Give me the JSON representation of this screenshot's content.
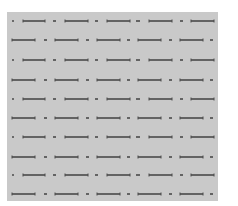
{
  "pattern": {
    "panel_color": "#c9c9c9",
    "stroke_color": "#4a4a4a",
    "rows": [
      {
        "y": 21,
        "segments": [
          [
            12,
            14
          ],
          [
            23,
            45
          ],
          [
            53,
            56
          ],
          [
            65,
            88
          ],
          [
            95,
            98
          ],
          [
            107,
            130
          ],
          [
            136,
            140
          ],
          [
            149,
            172
          ],
          [
            180,
            183
          ],
          [
            191,
            214
          ]
        ]
      },
      {
        "y": 40,
        "segments": [
          [
            12,
            35
          ],
          [
            44,
            47
          ],
          [
            55,
            78
          ],
          [
            86,
            89
          ],
          [
            97,
            120
          ],
          [
            127,
            130
          ],
          [
            138,
            161
          ],
          [
            169,
            172
          ],
          [
            180,
            203
          ],
          [
            210,
            213
          ]
        ]
      },
      {
        "y": 60,
        "segments": [
          [
            12,
            14
          ],
          [
            23,
            45
          ],
          [
            53,
            56
          ],
          [
            65,
            88
          ],
          [
            95,
            98
          ],
          [
            107,
            130
          ],
          [
            136,
            140
          ],
          [
            149,
            172
          ],
          [
            180,
            183
          ],
          [
            191,
            214
          ]
        ]
      },
      {
        "y": 80,
        "segments": [
          [
            12,
            35
          ],
          [
            44,
            47
          ],
          [
            55,
            78
          ],
          [
            86,
            89
          ],
          [
            97,
            120
          ],
          [
            127,
            130
          ],
          [
            138,
            161
          ],
          [
            169,
            172
          ],
          [
            180,
            203
          ],
          [
            210,
            213
          ]
        ]
      },
      {
        "y": 99,
        "segments": [
          [
            12,
            14
          ],
          [
            23,
            45
          ],
          [
            53,
            56
          ],
          [
            65,
            88
          ],
          [
            95,
            98
          ],
          [
            107,
            130
          ],
          [
            136,
            140
          ],
          [
            149,
            172
          ],
          [
            180,
            183
          ],
          [
            191,
            214
          ]
        ]
      },
      {
        "y": 118,
        "segments": [
          [
            12,
            35
          ],
          [
            44,
            47
          ],
          [
            55,
            78
          ],
          [
            86,
            89
          ],
          [
            97,
            120
          ],
          [
            127,
            130
          ],
          [
            138,
            161
          ],
          [
            169,
            172
          ],
          [
            180,
            203
          ],
          [
            210,
            213
          ]
        ]
      },
      {
        "y": 137,
        "segments": [
          [
            12,
            14
          ],
          [
            23,
            45
          ],
          [
            53,
            56
          ],
          [
            65,
            88
          ],
          [
            95,
            98
          ],
          [
            107,
            130
          ],
          [
            136,
            140
          ],
          [
            149,
            172
          ],
          [
            180,
            183
          ],
          [
            191,
            214
          ]
        ]
      },
      {
        "y": 157,
        "segments": [
          [
            12,
            35
          ],
          [
            44,
            47
          ],
          [
            55,
            78
          ],
          [
            86,
            89
          ],
          [
            97,
            120
          ],
          [
            127,
            130
          ],
          [
            138,
            161
          ],
          [
            169,
            172
          ],
          [
            180,
            203
          ],
          [
            210,
            213
          ]
        ]
      },
      {
        "y": 175,
        "segments": [
          [
            12,
            14
          ],
          [
            23,
            45
          ],
          [
            53,
            56
          ],
          [
            65,
            88
          ],
          [
            95,
            98
          ],
          [
            107,
            130
          ],
          [
            136,
            140
          ],
          [
            149,
            172
          ],
          [
            180,
            183
          ],
          [
            191,
            214
          ]
        ]
      },
      {
        "y": 194,
        "segments": [
          [
            12,
            35
          ],
          [
            44,
            47
          ],
          [
            55,
            78
          ],
          [
            86,
            89
          ],
          [
            97,
            120
          ],
          [
            127,
            130
          ],
          [
            138,
            161
          ],
          [
            169,
            172
          ],
          [
            180,
            203
          ],
          [
            210,
            213
          ]
        ]
      }
    ]
  }
}
